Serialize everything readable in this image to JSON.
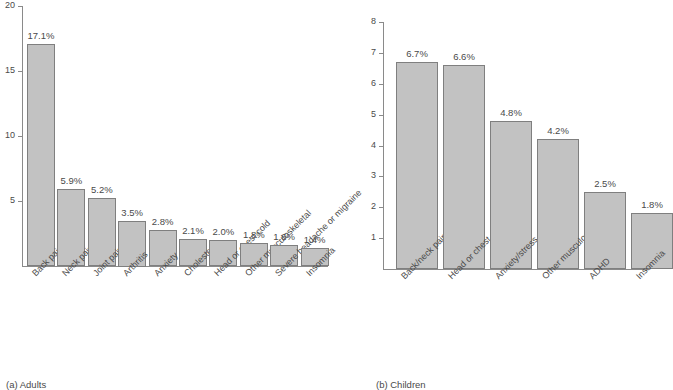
{
  "figure": {
    "captions": [
      {
        "text": "(a) Adults"
      },
      {
        "text": "(b) Children"
      }
    ]
  },
  "chart_data": [
    {
      "type": "bar",
      "title": "(a) Adults",
      "xlabel": "",
      "ylabel": "",
      "ylim": [
        0,
        20
      ],
      "yticks": [
        5,
        10,
        15,
        20
      ],
      "grid": false,
      "legend": "none",
      "categories": [
        "Back pain",
        "Neck pain",
        "Joint pain",
        "Arthritis",
        "Anxiety",
        "Cholesterol",
        "Head or chest cold",
        "Other musculoskeletal",
        "Severe headache or migraine",
        "Insomnia"
      ],
      "values": [
        17.1,
        5.9,
        5.2,
        3.5,
        2.8,
        2.1,
        2.0,
        1.8,
        1.6,
        1.4
      ],
      "data_labels": [
        "17.1%",
        "5.9%",
        "5.2%",
        "3.5%",
        "2.8%",
        "2.1%",
        "2.0%",
        "1.8%",
        "1.6%",
        "1.4%"
      ],
      "bar_color": "#c2c2c2",
      "bar_edge_color": "#7f7f7f"
    },
    {
      "type": "bar",
      "title": "(b) Children",
      "xlabel": "",
      "ylabel": "",
      "ylim": [
        0,
        8
      ],
      "yticks": [
        1,
        2,
        3,
        4,
        5,
        6,
        7,
        8
      ],
      "grid": false,
      "legend": "none",
      "categories": [
        "Back/neck pain",
        "Head or chest cold",
        "Anxiety/stress",
        "Other musculoskeletal",
        "ADHD",
        "Insomnia"
      ],
      "values": [
        6.7,
        6.6,
        4.8,
        4.2,
        2.5,
        1.8
      ],
      "data_labels": [
        "6.7%",
        "6.6%",
        "4.8%",
        "4.2%",
        "2.5%",
        "1.8%"
      ],
      "bar_color": "#c2c2c2",
      "bar_edge_color": "#7f7f7f"
    }
  ]
}
